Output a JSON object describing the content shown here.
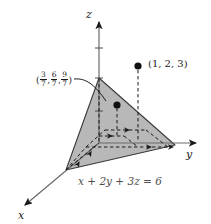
{
  "figure": {
    "background_color": "#ffffff",
    "plane_fill_color": "#b3b3b3",
    "line_color": "#1a1a1a",
    "width": 211,
    "height": 224
  },
  "axes": {
    "z_label": "z",
    "y_label": "y",
    "x_label": "x"
  },
  "plane": {
    "equation_label": "x + 2y + 3z = 6",
    "equation_terms": {
      "x_coefficient": 1,
      "y_coefficient": 2,
      "z_coefficient": 3,
      "constant": 6
    },
    "intercepts": {
      "x": 6,
      "y": 3,
      "z": 2
    }
  },
  "points": [
    {
      "name": "external-point",
      "label": "(1, 2, 3)",
      "coordinates": [
        1,
        2,
        3
      ]
    },
    {
      "name": "closest-point-on-plane",
      "label": "(3/7, 6/7, 9/7)",
      "fractions": [
        {
          "numerator": "3",
          "denominator": "7"
        },
        {
          "numerator": "6",
          "denominator": "7"
        },
        {
          "numerator": "9",
          "denominator": "7"
        }
      ],
      "open_paren": "(",
      "close_paren": ")",
      "separator": ","
    }
  ]
}
